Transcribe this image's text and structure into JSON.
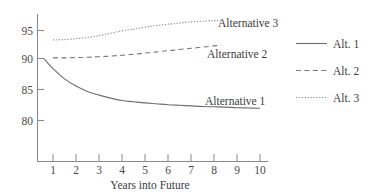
{
  "chart_data": {
    "type": "line",
    "title": "",
    "xlabel": "Years into Future",
    "ylabel": "",
    "xlim": [
      0.5,
      10.3
    ],
    "ylim": [
      77.5,
      97.5
    ],
    "grid": false,
    "legend_position": "right",
    "x_ticks": [
      "1",
      "2",
      "3",
      "4",
      "5",
      "6",
      "7",
      "8",
      "9",
      "10"
    ],
    "x_tick_values": [
      1,
      2,
      3,
      4,
      5,
      6,
      7,
      8,
      9,
      10
    ],
    "y_ticks": [
      "80",
      "85",
      "90",
      "95"
    ],
    "y_tick_values": [
      80,
      85,
      90,
      95
    ],
    "x": [
      0.6,
      1,
      1.5,
      2,
      2.5,
      3,
      3.5,
      4,
      4.5,
      5,
      5.5,
      6,
      6.5,
      7,
      7.5,
      8,
      8.5,
      9,
      9.5,
      10
    ],
    "series": [
      {
        "name": "Alt. 1",
        "style": "solid",
        "inline_label": "Alternative 1",
        "x": [
          0.6,
          1,
          1.5,
          2,
          2.5,
          3,
          3.5,
          4,
          4.5,
          5,
          5.5,
          6,
          6.5,
          7,
          7.5,
          8,
          8.5,
          9,
          9.5,
          10
        ],
        "values": [
          90.0,
          88.3,
          86.6,
          85.4,
          84.5,
          83.9,
          83.4,
          83.0,
          82.8,
          82.6,
          82.45,
          82.3,
          82.2,
          82.1,
          82.0,
          81.95,
          81.9,
          81.8,
          81.75,
          81.7
        ]
      },
      {
        "name": "Alt. 2",
        "style": "dashed",
        "inline_label": "Alternative 2",
        "x": [
          1,
          1.5,
          2,
          2.5,
          3,
          3.5,
          4,
          4.5,
          5,
          5.5,
          6,
          6.5,
          7,
          7.5,
          8,
          8.3
        ],
        "values": [
          90.1,
          90.1,
          90.15,
          90.2,
          90.3,
          90.4,
          90.55,
          90.7,
          90.9,
          91.1,
          91.3,
          91.5,
          91.7,
          91.9,
          92.1,
          92.2
        ]
      },
      {
        "name": "Alt. 3",
        "style": "dotted",
        "inline_label": "Alternative 3",
        "x": [
          1,
          1.5,
          2,
          2.5,
          3,
          3.5,
          4,
          4.5,
          5,
          5.5,
          6,
          6.5,
          7,
          7.5,
          8,
          8.3
        ],
        "values": [
          93.1,
          93.15,
          93.3,
          93.5,
          93.8,
          94.2,
          94.6,
          94.9,
          95.2,
          95.5,
          95.7,
          95.9,
          96.1,
          96.2,
          96.3,
          96.35
        ]
      }
    ]
  },
  "axis": {
    "x_title": "Years into Future",
    "y_tick_0": "80",
    "y_tick_1": "85",
    "y_tick_2": "90",
    "y_tick_3": "95",
    "x_tick_1": "1",
    "x_tick_2": "2",
    "x_tick_3": "3",
    "x_tick_4": "4",
    "x_tick_5": "5",
    "x_tick_6": "6",
    "x_tick_7": "7",
    "x_tick_8": "8",
    "x_tick_9": "9",
    "x_tick_10": "10"
  },
  "inline_labels": {
    "alt1": "Alternative 1",
    "alt2": "Alternative 2",
    "alt3": "Alternative 3"
  },
  "legend": {
    "items": [
      {
        "label": "Alt. 1",
        "style": "solid"
      },
      {
        "label": "Alt. 2",
        "style": "dashed"
      },
      {
        "label": "Alt. 3",
        "style": "dotted"
      }
    ]
  },
  "colors": {
    "axis": "#8a8a8a",
    "line_alt1": "#6e6e6e",
    "line_alt2": "#777777",
    "line_alt3": "#8d8d8d",
    "text": "#3d3d3d",
    "background": "#ffffff"
  }
}
